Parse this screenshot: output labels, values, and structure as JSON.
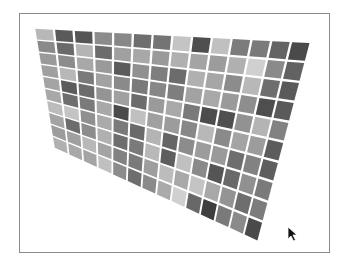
{
  "scene": {
    "description": "perspective-warped grid of grayscale tiles",
    "columns": 14,
    "rows": 10,
    "corners": {
      "top_left": [
        34,
        28
      ],
      "top_right": [
        311,
        42
      ],
      "bottom_right": [
        258,
        242
      ],
      "bottom_left": [
        54,
        148
      ]
    },
    "gap_color": "#ffffff",
    "frame_border_color": "#8a8a8a",
    "tiles": [
      [
        "#b8b8b8",
        "#5a5a5a",
        "#555555",
        "#8c8c8c",
        "#888888",
        "#6e6e6e",
        "#747474",
        "#c4c4c4",
        "#4e4e4e",
        "#c0c0c0",
        "#7c7c7c",
        "#7a7a7a",
        "#646464",
        "#4a4a4a"
      ],
      [
        "#8a8a8a",
        "#6a6a6a",
        "#b4b4b4",
        "#6c6c6c",
        "#a0a0a0",
        "#a8a8a8",
        "#9a9a9a",
        "#b0b0b0",
        "#a4a4a4",
        "#9c9c9c",
        "#b0b0b0",
        "#d0d0d0",
        "#8a8a8a",
        "#626262"
      ],
      [
        "#9a9a9a",
        "#8c8c8c",
        "#a8a8a8",
        "#9a9a9a",
        "#5c5c5c",
        "#909090",
        "#7e7e7e",
        "#6c6c6c",
        "#b0b0b0",
        "#a6a6a6",
        "#8c8c8c",
        "#b8b8b8",
        "#6e6e6e",
        "#5a5a5a"
      ],
      [
        "#a0a0a0",
        "#b8b8b8",
        "#7a7a7a",
        "#a2a2a2",
        "#8a8a8a",
        "#7a7a7a",
        "#868686",
        "#7e7e7e",
        "#a2a2a2",
        "#a8a8a8",
        "#9a9a9a",
        "#8e8e8e",
        "#4e4e4e",
        "#5a5a5a"
      ],
      [
        "#a4a4a4",
        "#5c5c5c",
        "#6c6c6c",
        "#949494",
        "#a0a0a0",
        "#6c6c6c",
        "#9a9a9a",
        "#a8a8a8",
        "#7a7a7a",
        "#4c4c4c",
        "#505050",
        "#929292",
        "#b4b4b4",
        "#828282"
      ],
      [
        "#a8a8a8",
        "#6e6e6e",
        "#7a7a7a",
        "#a8a8a8",
        "#4a4a4a",
        "#c0c0c0",
        "#a0a0a0",
        "#9c9c9c",
        "#888888",
        "#b8b8b8",
        "#8a8a8a",
        "#a4a4a4",
        "#9c9c9c",
        "#5c5c5c"
      ],
      [
        "#bcbcbc",
        "#c4c4c4",
        "#909090",
        "#aaaaaa",
        "#7a7a7a",
        "#6a6a6a",
        "#b4b4b4",
        "#666666",
        "#8c8c8c",
        "#9c9c9c",
        "#9a9a9a",
        "#6e6e6e",
        "#828282",
        "#5e5e5e"
      ],
      [
        "#a4a4a4",
        "#6c6c6c",
        "#8c8c8c",
        "#b0b0b0",
        "#6e6e6e",
        "#7a7a7a",
        "#b8b8b8",
        "#5e5e5e",
        "#c0c0c0",
        "#8a8a8a",
        "#555555",
        "#6a6a6a",
        "#909090",
        "#7a7a7a"
      ],
      [
        "#9c9c9c",
        "#a0a0a0",
        "#b8b8b8",
        "#a4a4a4",
        "#828282",
        "#7a7a7a",
        "#9e9e9e",
        "#bcbcbc",
        "#a8a8a8",
        "#c4c4c4",
        "#a8a8a8",
        "#949494",
        "#6e6e6e",
        "#7c7c7c"
      ],
      [
        "#b0b0b0",
        "#a8a8a8",
        "#a4a4a4",
        "#c0c0c0",
        "#8c8c8c",
        "#6e6e6e",
        "#8a8a8a",
        "#aaaaaa",
        "#d0d0d0",
        "#686868",
        "#3e3e3e",
        "#7a7a7a",
        "#8a8a8a",
        "#4a4a4a"
      ]
    ]
  },
  "cursor": {
    "type": "arrow-pointer",
    "position": [
      289,
      228
    ]
  }
}
